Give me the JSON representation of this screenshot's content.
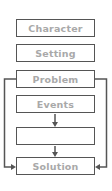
{
  "diagram": {
    "type": "story-map-flowchart",
    "colors": {
      "border": "#555555",
      "text": "#a9a9a9",
      "background": "#ffffff"
    },
    "boxes": [
      {
        "id": "character",
        "label": "Character"
      },
      {
        "id": "setting",
        "label": "Setting"
      },
      {
        "id": "problem",
        "label": "Problem"
      },
      {
        "id": "events",
        "label": "Events"
      },
      {
        "id": "blank",
        "label": ""
      },
      {
        "id": "solution",
        "label": "Solution"
      }
    ],
    "connectors": [
      {
        "from": "events",
        "to": "blank",
        "kind": "arrow-down"
      },
      {
        "from": "blank",
        "to": "solution",
        "kind": "arrow-down"
      },
      {
        "from": "problem",
        "to": "solution",
        "kind": "left-bracket-arrow"
      },
      {
        "from": "problem",
        "to": "solution",
        "kind": "right-bracket-arrow"
      }
    ]
  }
}
